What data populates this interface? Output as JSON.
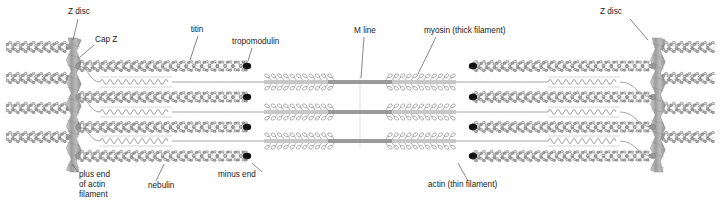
{
  "figure": {
    "background": "#ffffff",
    "width": 721,
    "height": 208
  },
  "labels": {
    "z_disc_left": "Z disc",
    "cap_z": "Cap Z",
    "titin": "titin",
    "tropomodulin": "tropomodulin",
    "m_line": "M line",
    "myosin": "myosin (thick filament)",
    "z_disc_right": "Z disc",
    "plus_end_1": "plus end",
    "plus_end_2": "of actin",
    "plus_end_3": "filament",
    "nebulin": "nebulin",
    "minus_end": "minus end",
    "actin": "actin (thin filament)"
  },
  "colors": {
    "text": "#1a1a1a",
    "leader": "#555555",
    "z_disc_fill": "#a8a8a8",
    "z_disc_edge": "#8a8a8a",
    "actin_bead_fill": "#c9c9c9",
    "actin_bead_edge": "#4a4a4a",
    "actin_strand": "#6b6b6b",
    "tropomodulin_cap": "#111111",
    "titin_stroke": "#808080",
    "myosin_stroke": "#777777",
    "nebulin_stroke": "#777777",
    "background": "#ffffff"
  },
  "structure": {
    "actin_rows_y": [
      66,
      97,
      127,
      156
    ],
    "titin_rows_y": [
      82,
      112,
      141
    ],
    "outer_actin_rows_y": [
      47,
      78,
      108,
      137
    ],
    "z_disc_left_x": 68,
    "z_disc_right_x": 652,
    "z_disc_width": 11,
    "z_disc_top": 38,
    "z_disc_bottom": 172,
    "m_line_x": 360,
    "myosin_half_length": 96,
    "actin_inner_end_left": 248,
    "actin_inner_end_right": 472,
    "sarcomere_left": 74,
    "sarcomere_right": 648
  },
  "components": [
    {
      "name": "z-disc",
      "count": 2,
      "description": "vertical zigzag banded plate anchoring actin plus ends"
    },
    {
      "name": "cap-z",
      "count": 8,
      "description": "actin plus-end capping protein at Z disc"
    },
    {
      "name": "actin-thin-filament",
      "count": 8,
      "description": "double-helical bead filament"
    },
    {
      "name": "tropomodulin",
      "count": 8,
      "description": "black cap at actin minus end"
    },
    {
      "name": "titin",
      "count": 6,
      "description": "coiled spring linking Z disc to thick filament"
    },
    {
      "name": "myosin-thick-filament",
      "count": 3,
      "description": "bipolar filament with heads, bare central M line zone"
    },
    {
      "name": "nebulin",
      "count": 8,
      "description": "thin strand running along actin filament"
    },
    {
      "name": "m-line",
      "count": 1,
      "description": "central bare zone of thick filaments"
    }
  ],
  "label_positions": {
    "z_disc_left": {
      "tx": 68,
      "ty": 14,
      "anchor": "start",
      "lx1": 78,
      "ly1": 19,
      "lx2": 73,
      "ly2": 40
    },
    "cap_z": {
      "tx": 95,
      "ty": 42,
      "anchor": "start",
      "lx1": 94,
      "ly1": 45,
      "lx2": 80,
      "ly2": 57
    },
    "titin": {
      "tx": 197,
      "ty": 32,
      "anchor": "middle",
      "lx1": 198,
      "ly1": 36,
      "lx2": 190,
      "ly2": 60
    },
    "tropomodulin": {
      "tx": 232,
      "ty": 44,
      "anchor": "start",
      "lx1": 252,
      "ly1": 48,
      "lx2": 248,
      "ly2": 61
    },
    "m_line": {
      "tx": 365,
      "ty": 33,
      "anchor": "middle",
      "lx1": 364,
      "ly1": 37,
      "lx2": 361,
      "ly2": 78
    },
    "myosin": {
      "tx": 424,
      "ty": 33,
      "anchor": "start",
      "lx1": 436,
      "ly1": 37,
      "lx2": 418,
      "ly2": 74
    },
    "z_disc_right": {
      "tx": 600,
      "ty": 14,
      "anchor": "start",
      "lx1": 630,
      "ly1": 19,
      "lx2": 648,
      "ly2": 40
    },
    "plus_end": {
      "tx": 79,
      "ty": 177,
      "anchor": "start",
      "lx1": 78,
      "ly1": 172,
      "lx2": 72,
      "ly2": 164
    },
    "nebulin": {
      "tx": 148,
      "ty": 188,
      "anchor": "start",
      "lx1": 156,
      "ly1": 181,
      "lx2": 164,
      "ly2": 164
    },
    "minus_end": {
      "tx": 218,
      "ty": 177,
      "anchor": "start",
      "lx1": 262,
      "ly1": 172,
      "lx2": 252,
      "ly2": 163
    },
    "actin": {
      "tx": 428,
      "ty": 187,
      "anchor": "start",
      "lx1": 468,
      "ly1": 181,
      "lx2": 458,
      "ly2": 163
    }
  }
}
